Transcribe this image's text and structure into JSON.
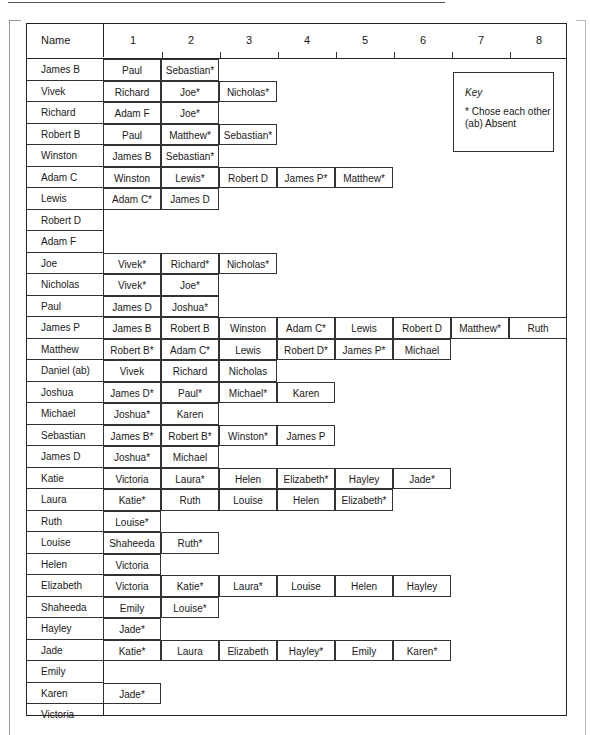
{
  "header": {
    "name_label": "Name",
    "columns": [
      "1",
      "2",
      "3",
      "4",
      "5",
      "6",
      "7",
      "8"
    ]
  },
  "key": {
    "title": "Key",
    "lines": [
      "* Chose each other",
      "(ab) Absent"
    ]
  },
  "rows": [
    {
      "name": "James B",
      "choices": [
        "Paul",
        "Sebastian*"
      ]
    },
    {
      "name": "Vivek",
      "choices": [
        "Richard",
        "Joe*",
        "Nicholas*"
      ]
    },
    {
      "name": "Richard",
      "choices": [
        "Adam F",
        "Joe*"
      ]
    },
    {
      "name": "Robert B",
      "choices": [
        "Paul",
        "Matthew*",
        "Sebastian*"
      ]
    },
    {
      "name": "Winston",
      "choices": [
        "James B",
        "Sebastian*"
      ]
    },
    {
      "name": "Adam C",
      "choices": [
        "Winston",
        "Lewis*",
        "Robert D",
        "James P*",
        "Matthew*"
      ]
    },
    {
      "name": "Lewis",
      "choices": [
        "Adam C*",
        "James D"
      ]
    },
    {
      "name": "Robert D",
      "choices": []
    },
    {
      "name": "Adam F",
      "choices": []
    },
    {
      "name": "Joe",
      "choices": [
        "Vivek*",
        "Richard*",
        "Nicholas*"
      ]
    },
    {
      "name": "Nicholas",
      "choices": [
        "Vivek*",
        "Joe*"
      ]
    },
    {
      "name": "Paul",
      "choices": [
        "James D",
        "Joshua*"
      ]
    },
    {
      "name": "James P",
      "choices": [
        "James B",
        "Robert B",
        "Winston",
        "Adam C*",
        "Lewis",
        "Robert D",
        "Matthew*",
        "Ruth"
      ]
    },
    {
      "name": "Matthew",
      "choices": [
        "Robert B*",
        "Adam C*",
        "Lewis",
        "Robert D*",
        "James P*",
        "Michael"
      ]
    },
    {
      "name": "Daniel (ab)",
      "choices": [
        "Vivek",
        "Richard",
        "Nicholas"
      ]
    },
    {
      "name": "Joshua",
      "choices": [
        "James D*",
        "Paul*",
        "Michael*",
        "Karen"
      ]
    },
    {
      "name": "Michael",
      "choices": [
        "Joshua*",
        "Karen"
      ]
    },
    {
      "name": "Sebastian",
      "choices": [
        "James B*",
        "Robert B*",
        "Winston*",
        "James P"
      ]
    },
    {
      "name": "James D",
      "choices": [
        "Joshua*",
        "Michael"
      ]
    },
    {
      "name": "Katie",
      "choices": [
        "Victoria",
        "Laura*",
        "Helen",
        "Elizabeth*",
        "Hayley",
        "Jade*"
      ]
    },
    {
      "name": "Laura",
      "choices": [
        "Katie*",
        "Ruth",
        "Louise",
        "Helen",
        "Elizabeth*"
      ]
    },
    {
      "name": "Ruth",
      "choices": [
        "Louise*"
      ]
    },
    {
      "name": "Louise",
      "choices": [
        "Shaheeda",
        "Ruth*"
      ]
    },
    {
      "name": "Helen",
      "choices": [
        "Victoria"
      ]
    },
    {
      "name": "Elizabeth",
      "choices": [
        "Victoria",
        "Katie*",
        "Laura*",
        "Louise",
        "Helen",
        "Hayley"
      ]
    },
    {
      "name": "Shaheeda",
      "choices": [
        "Emily",
        "Louise*"
      ]
    },
    {
      "name": "Hayley",
      "choices": [
        "Jade*"
      ]
    },
    {
      "name": "Jade",
      "choices": [
        "Katie*",
        "Laura",
        "Elizabeth",
        "Hayley*",
        "Emily",
        "Karen*"
      ]
    },
    {
      "name": "Emily",
      "choices": []
    },
    {
      "name": "Karen",
      "choices": [
        "Jade*"
      ]
    },
    {
      "name": "Victoria",
      "choices": []
    }
  ]
}
